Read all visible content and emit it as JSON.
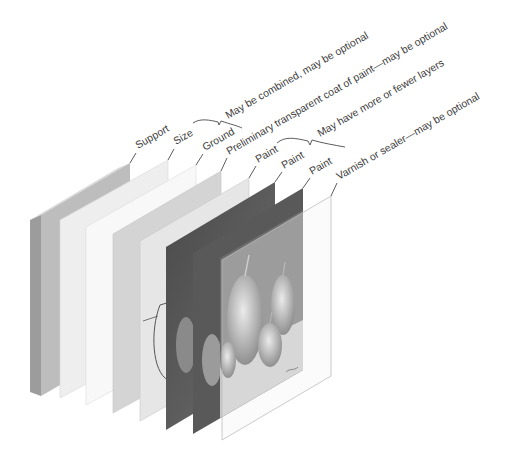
{
  "diagram": {
    "layers": [
      {
        "id": "support",
        "label": "Support"
      },
      {
        "id": "size",
        "label": "Size"
      },
      {
        "id": "ground",
        "label": "Ground"
      },
      {
        "id": "preliminary",
        "label": "Preliminary transparent coat of paint—may be optional"
      },
      {
        "id": "paint1",
        "label": "Paint"
      },
      {
        "id": "paint2",
        "label": "Paint"
      },
      {
        "id": "paint3",
        "label": "Paint"
      },
      {
        "id": "varnish",
        "label": "Varnish or sealer—may be optional"
      }
    ],
    "brackets": [
      {
        "id": "size-ground",
        "label": "May be combined, may be optional"
      },
      {
        "id": "paint-layers",
        "label": "May have more or fewer layers"
      }
    ],
    "colors": {
      "support_face": "#b9b9b9",
      "support_edge": "#9a9a9a",
      "size": "#ececec",
      "ground": "#f6f6f6",
      "preliminary": "#d2d2d2",
      "sketch": "#e4e4e4",
      "paint_dark": "#3c3c3c",
      "paint_mid": "#555555",
      "varnish": "#f2f2f2"
    }
  }
}
